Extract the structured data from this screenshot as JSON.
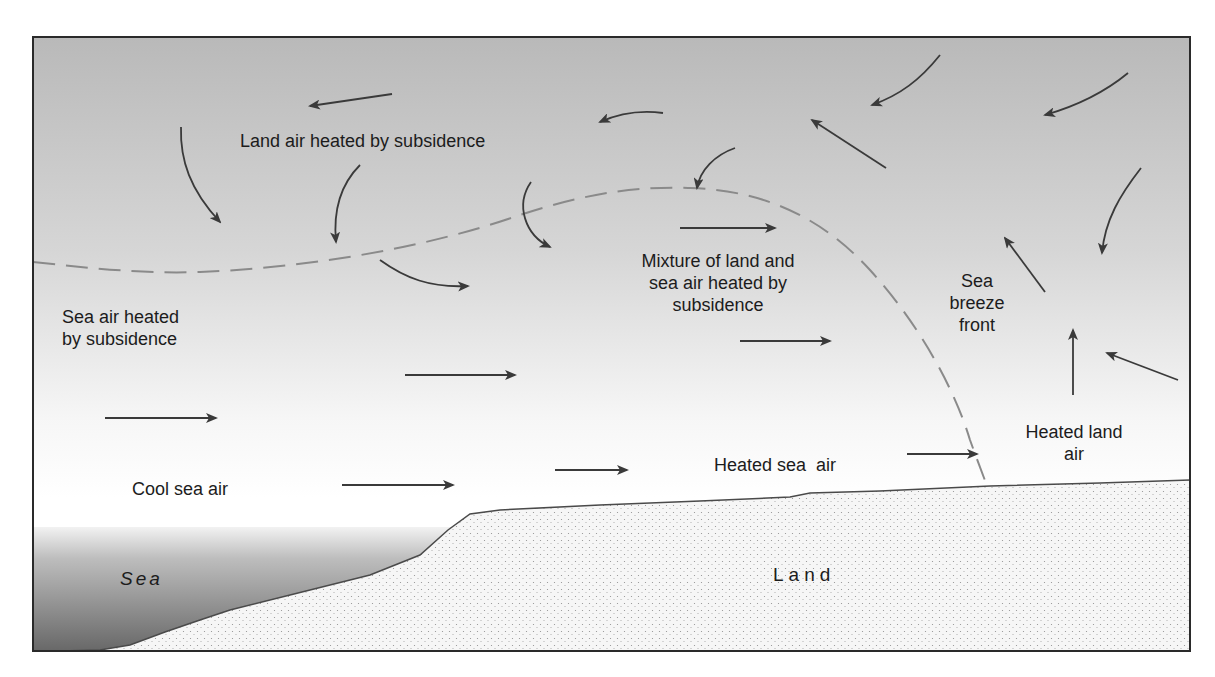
{
  "diagram": {
    "colors": {
      "frame": "#2a2a2a",
      "sky_top": "#b9b9b9",
      "sky_bottom": "#ffffff",
      "sea_top": "#f2f2f2",
      "sea_bottom": "#6e6e6e",
      "land_fill": "#f4f4f4",
      "land_dots": "#9a9a9a",
      "arrow": "#3a3a3a",
      "dashed_boundary": "#8a8a8a",
      "text": "#1c1c1c"
    },
    "labels": {
      "land_air_heated": "Land air heated by subsidence",
      "mixture": "Mixture of land and\nsea air heated by\nsubsidence",
      "sea_breeze_front": "Sea\nbreeze\nfront",
      "sea_air_heated": "Sea air heated\nby subsidence",
      "heated_land_air": "Heated land\nair",
      "heated_sea_air": "Heated sea  air",
      "cool_sea_air": "Cool sea air",
      "sea": "Sea",
      "land": "Land"
    },
    "label_positions": {
      "land_air_heated": {
        "x": 240,
        "y": 130
      },
      "mixture": {
        "x": 718,
        "y": 250
      },
      "sea_breeze_front": {
        "x": 972,
        "y": 270
      },
      "sea_air_heated": {
        "x": 62,
        "y": 308
      },
      "heated_land_air": {
        "x": 1059,
        "y": 421
      },
      "heated_sea_air": {
        "x": 714,
        "y": 454
      },
      "cool_sea_air": {
        "x": 132,
        "y": 480
      },
      "sea": {
        "x": 120,
        "y": 570
      },
      "land": {
        "x": 773,
        "y": 565
      }
    },
    "arrows": [
      {
        "id": "top-left-arrow",
        "d": "M392,94 L310,106"
      },
      {
        "id": "land-air-curve-1",
        "d": "M181,127 C180,160 190,190 220,222"
      },
      {
        "id": "land-air-curve-2",
        "d": "M360,165 C340,185 333,210 336,242"
      },
      {
        "id": "dip-curve-arrow",
        "d": "M531,182 C515,205 525,235 550,247"
      },
      {
        "id": "lower-curve-arrow",
        "d": "M380,260 C405,278 430,288 468,286"
      },
      {
        "id": "top-center-curve",
        "d": "M663,113 C640,110 620,113 600,122"
      },
      {
        "id": "peak-curve-arrow",
        "d": "M735,148 C715,155 700,170 697,188"
      },
      {
        "id": "mixture-arrow",
        "d": "M680,228 L775,228"
      },
      {
        "id": "mixture-low-arrow",
        "d": "M740,341 L830,341"
      },
      {
        "id": "sea-air-mid-arrow",
        "d": "M405,375 L515,375"
      },
      {
        "id": "sea-air-left-arrow",
        "d": "M105,418 L216,418"
      },
      {
        "id": "cool-sea-arrow",
        "d": "M342,485 L453,485"
      },
      {
        "id": "heated-sea-arrow-1",
        "d": "M555,470 L627,470"
      },
      {
        "id": "heated-sea-arrow-2",
        "d": "M907,454 L977,454"
      },
      {
        "id": "top-right-curve-1",
        "d": "M940,55 C920,80 900,95 872,105"
      },
      {
        "id": "top-right-curve-2",
        "d": "M1128,73 C1105,92 1080,105 1045,115"
      },
      {
        "id": "diagonal-up-left",
        "d": "M886,168 L812,120"
      },
      {
        "id": "right-curve-down",
        "d": "M1141,168 C1120,195 1105,220 1102,253"
      },
      {
        "id": "front-up-left",
        "d": "M1045,292 L1005,238"
      },
      {
        "id": "heated-land-up",
        "d": "M1073,395 L1073,330"
      },
      {
        "id": "right-edge-arrow",
        "d": "M1178,380 L1107,353"
      }
    ],
    "dashed_boundary": "M33,262 C90,268 140,274 200,272 C300,268 420,250 520,215 C590,192 640,186 690,188 C760,190 820,215 870,270 C920,325 955,390 970,440 C978,462 983,475 987,486",
    "sea_surface_y": 527,
    "ground_path": "M33,652 L60,651 L100,650 L130,645 L165,632 L200,620 L230,610 L290,595 L370,575 L420,555 L448,530 L470,514 L500,510 L600,505 L700,501 L790,497 L810,493 L880,491 L990,486 L1100,483 L1191,480"
  }
}
